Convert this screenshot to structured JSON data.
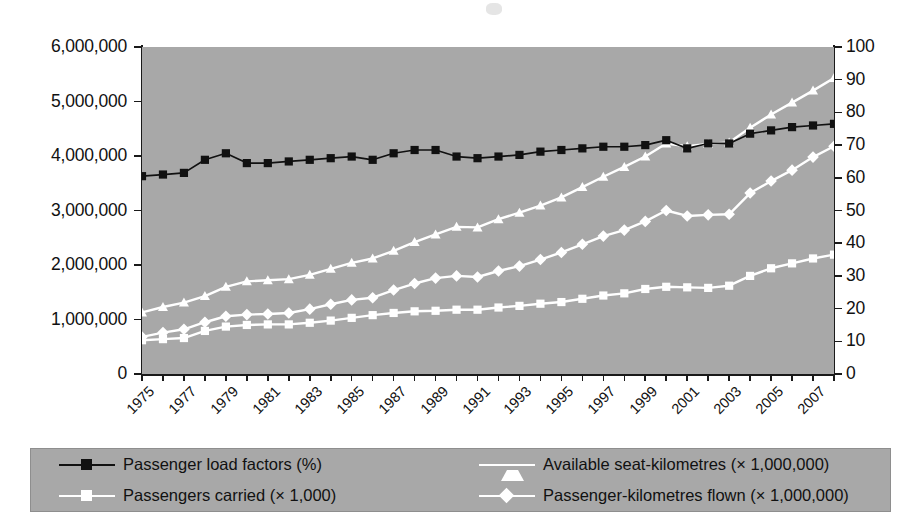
{
  "chart_data": {
    "type": "line",
    "title": "",
    "xlabel": "",
    "ylabel": "",
    "grid": false,
    "legend_position": "bottom",
    "x": [
      1975,
      1976,
      1977,
      1978,
      1979,
      1980,
      1981,
      1982,
      1983,
      1984,
      1985,
      1986,
      1987,
      1988,
      1989,
      1990,
      1991,
      1992,
      1993,
      1994,
      1995,
      1996,
      1997,
      1998,
      1999,
      2000,
      2001,
      2002,
      2003,
      2004,
      2005,
      2006,
      2007,
      2008
    ],
    "xticklabels": [
      "1975",
      "1977",
      "1979",
      "1981",
      "1983",
      "1985",
      "1987",
      "1989",
      "1991",
      "1993",
      "1995",
      "1997",
      "1999",
      "2001",
      "2003",
      "2005",
      "2007"
    ],
    "axes": [
      {
        "side": "left",
        "ylim": [
          0,
          6000000
        ],
        "ticks": [
          0,
          1000000,
          2000000,
          3000000,
          4000000,
          5000000,
          6000000
        ],
        "ticklabels": [
          "0",
          "1,000,000",
          "2,000,000",
          "3,000,000",
          "4,000,000",
          "5,000,000",
          "6,000,000"
        ]
      },
      {
        "side": "right",
        "ylim": [
          0,
          100
        ],
        "ticks": [
          0,
          10,
          20,
          30,
          40,
          50,
          60,
          70,
          80,
          90,
          100
        ],
        "ticklabels": [
          "0",
          "10",
          "20",
          "30",
          "40",
          "50",
          "60",
          "70",
          "80",
          "90",
          "100"
        ]
      }
    ],
    "series": [
      {
        "name": "Passenger load factors (%)",
        "axis": "right",
        "marker": "square",
        "color": "#111111",
        "line_color": "#111111",
        "values": [
          60.5,
          61.0,
          61.5,
          65.5,
          67.5,
          64.5,
          64.5,
          65.0,
          65.5,
          66.0,
          66.5,
          65.5,
          67.5,
          68.5,
          68.5,
          66.5,
          66.0,
          66.5,
          67.0,
          68.0,
          68.5,
          69.0,
          69.5,
          69.5,
          70.0,
          71.5,
          69.0,
          70.5,
          70.5,
          73.5,
          74.5,
          75.5,
          76.0,
          76.5
        ]
      },
      {
        "name": "Passengers carried (× 1,000)",
        "axis": "left",
        "marker": "square",
        "color": "#ffffff",
        "line_color": "#ffffff",
        "values": [
          620000,
          640000,
          660000,
          790000,
          870000,
          900000,
          910000,
          910000,
          940000,
          980000,
          1030000,
          1080000,
          1120000,
          1150000,
          1160000,
          1180000,
          1180000,
          1220000,
          1250000,
          1290000,
          1320000,
          1380000,
          1440000,
          1480000,
          1560000,
          1600000,
          1590000,
          1580000,
          1620000,
          1800000,
          1940000,
          2030000,
          2120000,
          2190000
        ]
      },
      {
        "name": "Available seat-kilometres (× 1,000,000)",
        "axis": "left",
        "marker": "triangle",
        "color": "#ffffff",
        "line_color": "#ffffff",
        "values": [
          1130000,
          1230000,
          1310000,
          1430000,
          1600000,
          1700000,
          1720000,
          1740000,
          1820000,
          1930000,
          2040000,
          2120000,
          2260000,
          2420000,
          2560000,
          2700000,
          2690000,
          2840000,
          2960000,
          3090000,
          3240000,
          3430000,
          3620000,
          3800000,
          3990000,
          4230000,
          4180000,
          4220000,
          4250000,
          4520000,
          4760000,
          4980000,
          5200000,
          5430000
        ]
      },
      {
        "name": "Passenger-kilometres flown (× 1,000,000)",
        "axis": "left",
        "marker": "diamond",
        "color": "#ffffff",
        "line_color": "#ffffff",
        "values": [
          680000,
          760000,
          820000,
          950000,
          1060000,
          1090000,
          1100000,
          1120000,
          1190000,
          1280000,
          1360000,
          1400000,
          1540000,
          1660000,
          1760000,
          1800000,
          1780000,
          1890000,
          1980000,
          2100000,
          2230000,
          2380000,
          2530000,
          2640000,
          2800000,
          3000000,
          2900000,
          2920000,
          2930000,
          3320000,
          3540000,
          3740000,
          3980000,
          4180000
        ]
      }
    ]
  },
  "legend": {
    "items": [
      {
        "label": "Passenger load factors (%)",
        "marker": "square",
        "tone": "dark"
      },
      {
        "label": "Passengers carried (× 1,000)",
        "marker": "square",
        "tone": "light"
      },
      {
        "label": "Available seat-kilometres (× 1,000,000)",
        "marker": "triangle",
        "tone": "light"
      },
      {
        "label": "Passenger-kilometres flown (× 1,000,000)",
        "marker": "diamond",
        "tone": "light"
      }
    ]
  },
  "colors": {
    "plot_background": "#a8a8a8",
    "page_background": "#ffffff",
    "dark_series": "#111111",
    "light_series": "#ffffff",
    "axis": "#1a1a1a"
  }
}
